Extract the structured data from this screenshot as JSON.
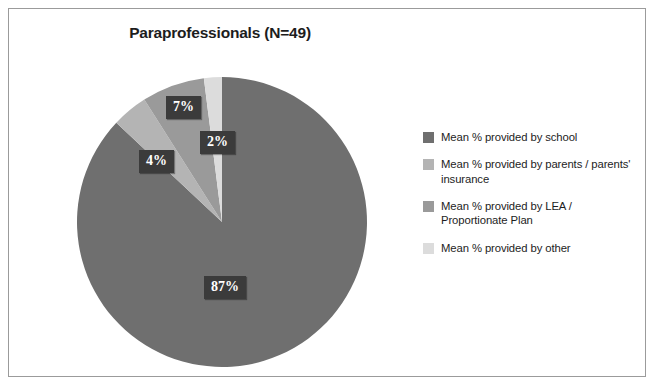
{
  "figure": {
    "title": "Paraprofessionals (N=49)",
    "frame_color": "#9b9b9b",
    "background": "#ffffff"
  },
  "chart_data": {
    "type": "pie",
    "title": "Paraprofessionals (N=49)",
    "xlabel": "",
    "ylabel": "",
    "legend_position": "right",
    "grid": false,
    "start_angle_deg": 0,
    "direction": "clockwise",
    "categories": [
      "Mean % provided by school",
      "Mean % provided by parents / parents' insurance",
      "Mean % provided by LEA / Proportionate Plan",
      "Mean % provided by other"
    ],
    "values": [
      87,
      4,
      7,
      2
    ],
    "value_labels": [
      "87%",
      "4%",
      "7%",
      "2%"
    ],
    "colors": [
      "#6f6f6f",
      "#b4b4b4",
      "#9a9a9a",
      "#dcdcdc"
    ],
    "n": 49
  },
  "labels": {
    "school": "87%",
    "parents": "4%",
    "lea": "7%",
    "other": "2%"
  },
  "legend": {
    "items": [
      {
        "label": "Mean % provided by school",
        "color": "#6f6f6f"
      },
      {
        "label": "Mean % provided by parents / parents' insurance",
        "color": "#b4b4b4"
      },
      {
        "label": "Mean % provided by LEA / Proportionate Plan",
        "color": "#9a9a9a"
      },
      {
        "label": "Mean % provided by other",
        "color": "#dcdcdc"
      }
    ]
  }
}
